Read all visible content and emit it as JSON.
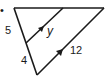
{
  "diagram": {
    "type": "triangle-with-parallel-segment",
    "labels": {
      "left_upper_segment": "5",
      "left_lower_segment": "4",
      "parallel_segment": "y",
      "base_side": "12"
    },
    "bullet": "•",
    "colors": {
      "stroke": "#1a1a1a",
      "background": "#ffffff"
    }
  }
}
